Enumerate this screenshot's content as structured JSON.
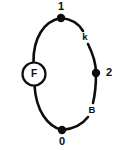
{
  "diagram": {
    "background_color": "#ffffff",
    "stroke_color": "#0d0d0d",
    "nodes": [
      {
        "id": "n1",
        "label": "1",
        "x": 61,
        "y": 18,
        "label_x": 61,
        "label_y": 7,
        "radius": 4.2
      },
      {
        "id": "n2",
        "label": "2",
        "x": 96,
        "y": 73,
        "label_x": 109,
        "label_y": 73,
        "radius": 4.2
      },
      {
        "id": "n0",
        "label": "0",
        "x": 62,
        "y": 130,
        "label_x": 62,
        "label_y": 142,
        "radius": 4.2
      }
    ],
    "components": [
      {
        "id": "cF",
        "label": "F",
        "x": 34,
        "y": 74,
        "radius": 11.5
      }
    ],
    "edge_labels": [
      {
        "id": "k",
        "label": "k",
        "x": 85,
        "y": 37
      },
      {
        "id": "B",
        "label": "B",
        "x": 92,
        "y": 110
      }
    ],
    "arcs": [
      {
        "id": "arc-top-left",
        "d": "M 61 18 C 44 21 33 38 33.5 62.5",
        "note": "node 1 to F component"
      },
      {
        "id": "arc-bottom-left",
        "d": "M 34.5 85.5 C 36 110 47 126 62 130",
        "note": "F component to node 0"
      },
      {
        "id": "arc-top-right-upper",
        "d": "M 61 18 C 72 19 79 24 83 31",
        "note": "node 1 toward k gap"
      },
      {
        "id": "arc-top-right-lower",
        "d": "M 88 44 C 93 54 96 63 96 73",
        "note": "k gap toward node 2"
      },
      {
        "id": "arc-bottom-right-upper",
        "d": "M 96 73 C 96 85 95 95 93 103",
        "note": "node 2 toward B gap"
      },
      {
        "id": "arc-bottom-right-lower",
        "d": "M 88 117 C 82 125 73 129 62 130",
        "note": "B gap toward node 0"
      }
    ]
  }
}
